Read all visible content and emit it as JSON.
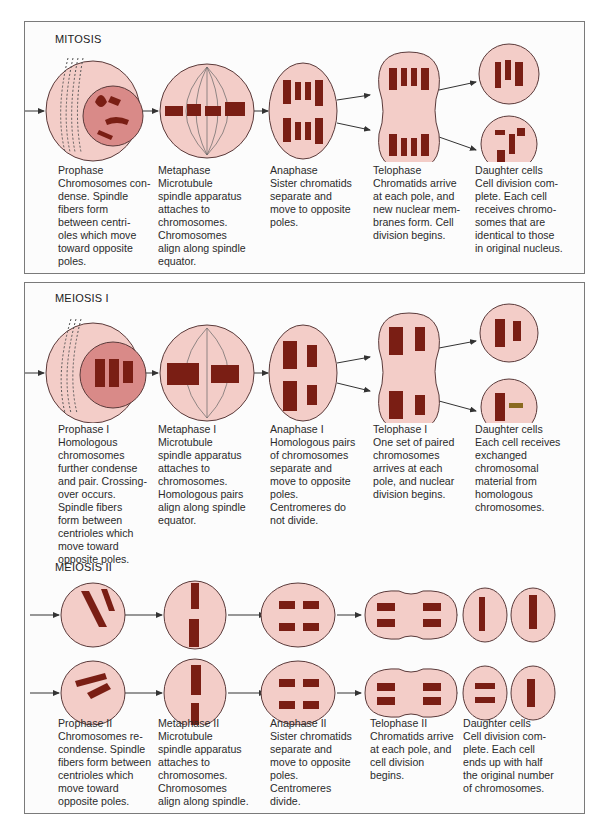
{
  "mitosis": {
    "title": "MITOSIS",
    "stages": [
      {
        "name": "Prophase",
        "text": "Chromosomes con-\ndense. Spindle\nfibers form\nbetween centri-\noles which move\ntoward opposite\npoles."
      },
      {
        "name": "Metaphase",
        "text": "Microtubule\nspindle apparatus\nattaches to\nchromosomes.\nChromosomes\nalign along spindle\nequator."
      },
      {
        "name": "Anaphase",
        "text": "Sister chromatids\nseparate and\nmove to opposite\npoles."
      },
      {
        "name": "Telophase",
        "text": "Chromatids arrive\nat each pole, and\nnew nuclear mem-\nbranes form. Cell\ndivision begins."
      },
      {
        "name": "Daughter cells",
        "text": "Cell division com-\nplete. Each cell\nreceives chromo-\nsomes that are\nidentical to those\nin original nucleus."
      }
    ]
  },
  "meiosis1": {
    "title": "MEIOSIS I",
    "stages": [
      {
        "name": "Prophase I",
        "text": "Homologous\nchromosomes\nfurther condense\nand pair. Crossing-\nover occurs.\nSpindle fibers\nform between\ncentrioles which\nmove toward\nopposite poles."
      },
      {
        "name": "Metaphase I",
        "text": "Microtubule\nspindle apparatus\nattaches to\nchromosomes.\nHomologous pairs\nalign along spindle\nequator."
      },
      {
        "name": "Anaphase I",
        "text": "Homologous pairs\nof chromosomes\nseparate and\nmove to opposite\npoles.\nCentromeres do\nnot divide."
      },
      {
        "name": "Telophase I",
        "text": "One set of paired\nchromosomes\narrives at each\npole, and nuclear\ndivision begins."
      },
      {
        "name": "Daughter cells",
        "text": "Each cell receives\nexchanged\nchromosomal\nmaterial from\nhomologous\nchromosomes."
      }
    ]
  },
  "meiosis2": {
    "title": "MEIOSIS II",
    "stages": [
      {
        "name": "Prophase II",
        "text": "Chromosomes re-\ncondense. Spindle\nfibers form between\ncentrioles which\nmove toward\nopposite poles."
      },
      {
        "name": "Metaphase II",
        "text": "Microtubule\nspindle apparatus\nattaches to\nchromosomes.\nChromosomes\nalign along spindle."
      },
      {
        "name": "Anaphase II",
        "text": "Sister chromatids\nseparate and\nmove to opposite\npoles.\nCentromeres\ndivide."
      },
      {
        "name": "Telophase II",
        "text": "Chromatids arrive\nat each pole, and\ncell division\nbegins."
      },
      {
        "name": "Daughter cells",
        "text": "Cell division com-\nplete. Each cell\nends up with half\nthe original number\nof chromosomes."
      }
    ]
  },
  "colors": {
    "cell_fill": "#f3cdc8",
    "cell_stroke": "#5a3a3a",
    "nucleus_fill": "#d98a88",
    "chromosome": "#7a1e14",
    "arrow": "#333333",
    "panel_border": "#7a7a7a"
  }
}
